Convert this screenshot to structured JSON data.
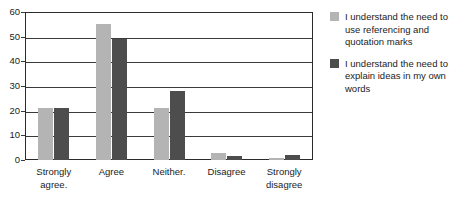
{
  "chart_data": {
    "type": "bar",
    "title": "",
    "subtitle": "",
    "xlabel": "",
    "ylabel": "",
    "categories": [
      "Strongly\nagree.",
      "Agree",
      "Neither.",
      "Disagree",
      "Strongly\ndisagree"
    ],
    "series": [
      {
        "name": "I understand the need to use referencing and quotation marks",
        "color": "#b4b4b4",
        "values": [
          21,
          55,
          21,
          3,
          1
        ]
      },
      {
        "name": "I understand the need to explain ideas in my own words",
        "color": "#4d4d4d",
        "values": [
          21,
          49,
          28,
          1.5,
          2
        ]
      }
    ],
    "ylim": [
      0,
      60
    ],
    "yticks": [
      0,
      10,
      20,
      30,
      40,
      50,
      60
    ],
    "ytick_labels": [
      "0",
      "10",
      "20",
      "30",
      "40",
      "50",
      "60"
    ],
    "grid": "horizontal",
    "legend_position": "right",
    "annotations": []
  },
  "legend": {
    "entries": [
      {
        "label": "I understand the need to use referencing and quotation marks"
      },
      {
        "label": "I understand the need to explain ideas in my own words"
      }
    ]
  }
}
